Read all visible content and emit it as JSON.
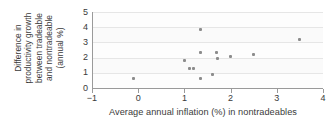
{
  "chart_data": {
    "type": "scatter",
    "title": "",
    "xlabel": "Average annual inflation (%) in nontradeables",
    "ylabel_lines": [
      "Difference in",
      "productivity growth",
      "between tradeable",
      "and nontradeable",
      "(annual %)"
    ],
    "xlim": [
      -1,
      4
    ],
    "ylim": [
      0,
      5
    ],
    "xticks": [
      -1,
      0,
      1,
      2,
      3,
      4
    ],
    "xtick_labels": [
      "−1",
      "0",
      "1",
      "2",
      "3",
      "4"
    ],
    "yticks": [
      0,
      1,
      2,
      3,
      4,
      5
    ],
    "ytick_labels": [
      "0",
      "1",
      "2",
      "3",
      "4",
      "5"
    ],
    "grid": "horizontal",
    "legend": "none",
    "marker_color": "#8c8c8c",
    "axis_color": "#9a9a9a",
    "gridline_color": "#e6e6e6",
    "points": [
      {
        "x": -0.1,
        "y": 0.65
      },
      {
        "x": 1.0,
        "y": 1.8
      },
      {
        "x": 1.1,
        "y": 1.3
      },
      {
        "x": 1.2,
        "y": 1.3
      },
      {
        "x": 1.35,
        "y": 3.85
      },
      {
        "x": 1.35,
        "y": 2.35
      },
      {
        "x": 1.35,
        "y": 0.6
      },
      {
        "x": 1.6,
        "y": 0.9
      },
      {
        "x": 1.7,
        "y": 2.35
      },
      {
        "x": 1.72,
        "y": 1.95
      },
      {
        "x": 2.0,
        "y": 2.1
      },
      {
        "x": 2.5,
        "y": 2.2
      },
      {
        "x": 3.5,
        "y": 3.2
      }
    ]
  }
}
